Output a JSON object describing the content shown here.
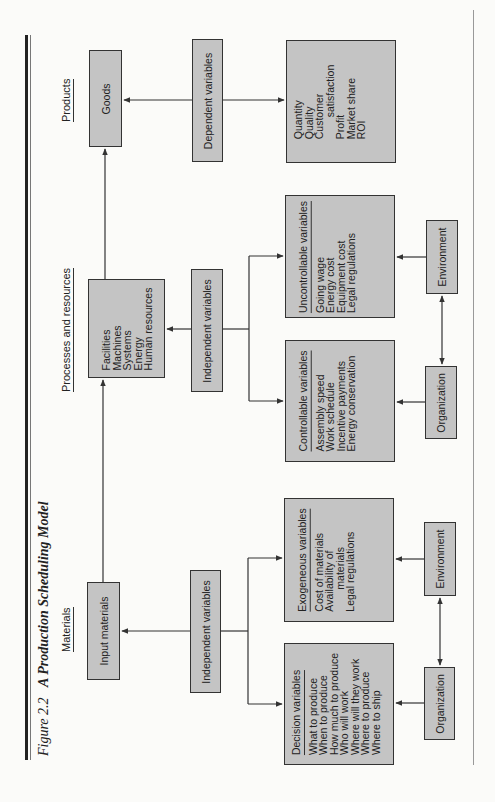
{
  "figure": {
    "number": "Figure 2.2",
    "title": "A Production Scheduling Model"
  },
  "column_headers": {
    "products": "Products",
    "processes": "Processes and resources",
    "materials": "Materials"
  },
  "nodes": {
    "goods": "Goods",
    "dependent_variables": "Dependent variables",
    "outcomes": {
      "lines": [
        "Quantity",
        "Quality",
        "Customer",
        "satisfaction",
        "Profit",
        "Market share",
        "ROI"
      ]
    },
    "resources": {
      "lines": [
        "Facilities",
        "Machines",
        "Systems",
        "Energy",
        "Human resources"
      ]
    },
    "independent_variables_upper": "Independent variables",
    "uncontrollable": {
      "heading": "Uncontrollable variables",
      "lines": [
        "Going wage",
        "Energy cost",
        "Equipment cost",
        "Legal regulations"
      ]
    },
    "controllable": {
      "heading": "Controllable variables",
      "lines": [
        "Assembly speed",
        "Work schedule",
        "Incentive payments",
        "Energy conservation"
      ]
    },
    "environment_upper": "Environment",
    "organization_upper": "Organization",
    "input_materials": "Input materials",
    "independent_variables_lower": "Independent variables",
    "exogeneous": {
      "heading": "Exogeneous variables",
      "lines": [
        "Cost of materials",
        "Availability of",
        "materials",
        "Legal regulations"
      ]
    },
    "decision": {
      "heading": "Decision variables",
      "lines": [
        "What to produce",
        "When to produce",
        "How much to produce",
        "Who will work",
        "Where will they work",
        "Where to produce",
        "Where to ship"
      ]
    },
    "environment_lower": "Environment",
    "organization_lower": "Organization"
  },
  "colors": {
    "box_fill": "#c4c4c4",
    "box_border": "#333333",
    "background": "#fbfbf9",
    "line": "#333333"
  }
}
